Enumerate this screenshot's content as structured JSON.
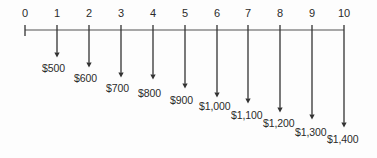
{
  "figure": {
    "name": "cash-flow-timeline"
  },
  "axis": {
    "line_color": "#8a8a8a",
    "tick_color": "#333333",
    "start_x": 25,
    "end_x": 344,
    "baseline_y": 30,
    "tick_labels": [
      "0",
      "1",
      "2",
      "3",
      "4",
      "5",
      "6",
      "7",
      "8",
      "9",
      "10"
    ]
  },
  "arrow": {
    "color": "#333333",
    "direction": "down"
  },
  "chart_data": {
    "type": "bar",
    "title": "",
    "xlabel": "",
    "ylabel": "",
    "grid": false,
    "legend": "none",
    "xlim": [
      0,
      10
    ],
    "x": [
      1,
      2,
      3,
      4,
      5,
      6,
      7,
      8,
      9,
      10
    ],
    "categories": [
      "1",
      "2",
      "3",
      "4",
      "5",
      "6",
      "7",
      "8",
      "9",
      "10"
    ],
    "values": [
      500,
      600,
      700,
      800,
      900,
      1000,
      1100,
      1200,
      1300,
      1400
    ],
    "value_labels": [
      "$500",
      "$600",
      "$700",
      "$800",
      "$900",
      "$1,000",
      "$1,100",
      "$1,200",
      "$1,300",
      "$1,400"
    ],
    "tick_labels": [
      "0",
      "1",
      "2",
      "3",
      "4",
      "5",
      "6",
      "7",
      "8",
      "9",
      "10"
    ]
  },
  "ticks": [
    {
      "label": "0",
      "x": 25,
      "has_arrow": false,
      "tick_top": 25,
      "tick_bottom": 36
    },
    {
      "label": "1",
      "x": 57,
      "has_arrow": true,
      "tick_top": 25,
      "tick_bottom": 36,
      "arrow_end_y": 58
    },
    {
      "label": "2",
      "x": 89,
      "has_arrow": true,
      "tick_top": 25,
      "tick_bottom": 36,
      "arrow_end_y": 68
    },
    {
      "label": "3",
      "x": 121,
      "has_arrow": true,
      "tick_top": 25,
      "tick_bottom": 36,
      "arrow_end_y": 78
    },
    {
      "label": "4",
      "x": 153,
      "has_arrow": true,
      "tick_top": 25,
      "tick_bottom": 36,
      "arrow_end_y": 80
    },
    {
      "label": "5",
      "x": 185,
      "has_arrow": true,
      "tick_top": 25,
      "tick_bottom": 36,
      "arrow_end_y": 89
    },
    {
      "label": "6",
      "x": 217,
      "has_arrow": true,
      "tick_top": 25,
      "tick_bottom": 36,
      "arrow_end_y": 98
    },
    {
      "label": "7",
      "x": 248,
      "has_arrow": true,
      "tick_top": 25,
      "tick_bottom": 36,
      "arrow_end_y": 104
    },
    {
      "label": "8",
      "x": 280,
      "has_arrow": true,
      "tick_top": 25,
      "tick_bottom": 36,
      "arrow_end_y": 113
    },
    {
      "label": "9",
      "x": 312,
      "has_arrow": true,
      "tick_top": 25,
      "tick_bottom": 36,
      "arrow_end_y": 120
    },
    {
      "label": "10",
      "x": 344,
      "has_arrow": true,
      "tick_top": 25,
      "tick_bottom": 36,
      "arrow_end_y": 128
    }
  ],
  "tick_label_y": 8,
  "cash_flows": [
    {
      "period": "1",
      "amount": "$500",
      "x": 42,
      "y": 63
    },
    {
      "period": "2",
      "amount": "$600",
      "x": 74,
      "y": 73
    },
    {
      "period": "3",
      "amount": "$700",
      "x": 106,
      "y": 83
    },
    {
      "period": "4",
      "amount": "$800",
      "x": 138,
      "y": 88
    },
    {
      "period": "5",
      "amount": "$900",
      "x": 170,
      "y": 95
    },
    {
      "period": "6",
      "amount": "$1,000",
      "x": 199,
      "y": 101
    },
    {
      "period": "7",
      "amount": "$1,100",
      "x": 231,
      "y": 110
    },
    {
      "period": "8",
      "amount": "$1,200",
      "x": 263,
      "y": 118
    },
    {
      "period": "9",
      "amount": "$1,300",
      "x": 295,
      "y": 127
    },
    {
      "period": "10",
      "amount": "$1,400",
      "x": 327,
      "y": 134
    }
  ]
}
